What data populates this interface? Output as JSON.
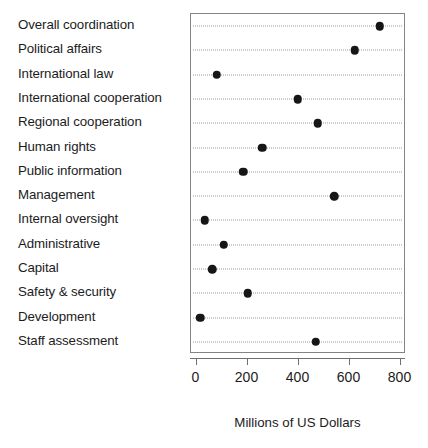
{
  "chart_data": {
    "type": "scatter",
    "subtype": "dot-plot",
    "title": "",
    "xlabel": "Millions of US Dollars",
    "ylabel": "",
    "xlim": [
      0,
      800
    ],
    "xticks": [
      0,
      200,
      400,
      600,
      800
    ],
    "xticklabels": [
      "0",
      "200",
      "400",
      "600",
      "800"
    ],
    "grid": true,
    "grid_axis": "y",
    "grid_style": "dotted",
    "legend": null,
    "categories": [
      "Overall coordination",
      "Political affairs",
      "International law",
      "International cooperation",
      "Regional cooperation",
      "Human rights",
      "Public information",
      "Management",
      "Internal oversight",
      "Administrative",
      "Capital",
      "Safety & security",
      "Development",
      "Staff assessment"
    ],
    "values": [
      718,
      620,
      80,
      397,
      475,
      258,
      183,
      541,
      32,
      106,
      61,
      201,
      15,
      467
    ],
    "marker": {
      "shape": "circle",
      "color": "#161616",
      "size": 8.5
    },
    "axis_color": "#6f6f6f",
    "grid_color": "#9a9a9a",
    "background": "#ffffff"
  }
}
